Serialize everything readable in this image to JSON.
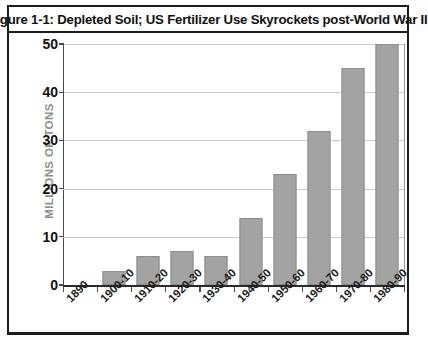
{
  "figure": {
    "title": "Figure 1-1: Depleted Soil; US Fertilizer Use Skyrockets post-World War II",
    "frame_color": "#1c1c1c",
    "background": "#ffffff"
  },
  "chart_data": {
    "type": "bar",
    "title": "Figure 1-1: Depleted Soil; US Fertilizer Use Skyrockets post-World War II",
    "xlabel": "",
    "ylabel": "MILLIONS OF TONS",
    "categories": [
      "1890",
      "1900-10",
      "1910-20",
      "1920-30",
      "1930-40",
      "1940-50",
      "1950-60",
      "1960-70",
      "1970-80",
      "1980-90"
    ],
    "values": [
      0,
      3,
      6,
      7,
      6,
      14,
      23,
      32,
      45,
      50
    ],
    "ylim": [
      0,
      50
    ],
    "yticks": [
      0,
      10,
      20,
      30,
      40,
      50
    ],
    "ytick_labels": [
      "0",
      "10",
      "20",
      "30",
      "40",
      "50"
    ],
    "grid": true,
    "grid_axis": "y",
    "legend": false,
    "bar_color": "#a3a3a3",
    "bar_edge_color": "#8d8d8d",
    "grid_color": "#c9c9c9",
    "axis_color": "#4a4a4a",
    "ylabel_color": "#8e8e8e"
  }
}
